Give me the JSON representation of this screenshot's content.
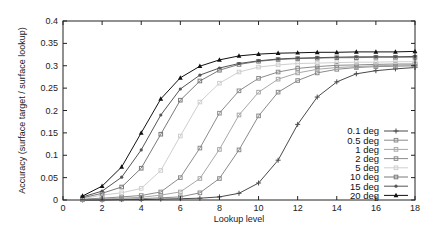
{
  "chart_data": {
    "type": "line",
    "title": "",
    "xlabel": "Lookup level",
    "ylabel": "Accuracy (surface target / surface lookup)",
    "xlim": [
      0,
      18
    ],
    "ylim": [
      0,
      0.4
    ],
    "xticks": [
      0,
      2,
      4,
      6,
      8,
      10,
      12,
      14,
      16,
      18
    ],
    "yticks": [
      0,
      0.05,
      0.1,
      0.15,
      0.2,
      0.25,
      0.3,
      0.35,
      0.4
    ],
    "ytick_labels": [
      "0",
      "0.05",
      "0.1",
      "0.15",
      "0.2",
      "0.25",
      "0.3",
      "0.35",
      "0.4"
    ],
    "grid": false,
    "legend_position": "lower right (inside)",
    "x": [
      1,
      2,
      3,
      4,
      5,
      6,
      7,
      8,
      9,
      10,
      11,
      12,
      13,
      14,
      15,
      16,
      17,
      18
    ],
    "series": [
      {
        "name": "0.1 deg",
        "color": "#4a4a4a",
        "marker": "plus",
        "values": [
          0.0,
          0.0,
          0.001,
          0.001,
          0.002,
          0.003,
          0.004,
          0.007,
          0.015,
          0.038,
          0.089,
          0.169,
          0.23,
          0.264,
          0.282,
          0.289,
          0.293,
          0.296
        ]
      },
      {
        "name": "0.5 deg",
        "color": "#8a8a8a",
        "marker": "square",
        "values": [
          0.001,
          0.001,
          0.002,
          0.003,
          0.005,
          0.007,
          0.016,
          0.048,
          0.112,
          0.188,
          0.241,
          0.267,
          0.284,
          0.292,
          0.296,
          0.298,
          0.299,
          0.3
        ]
      },
      {
        "name": "1 deg",
        "color": "#a8a8a8",
        "marker": "square",
        "values": [
          0.001,
          0.002,
          0.004,
          0.006,
          0.011,
          0.018,
          0.048,
          0.113,
          0.19,
          0.241,
          0.27,
          0.284,
          0.292,
          0.296,
          0.298,
          0.3,
          0.301,
          0.302
        ]
      },
      {
        "name": "2 deg",
        "color": "#8c8c8c",
        "marker": "square",
        "values": [
          0.002,
          0.004,
          0.007,
          0.01,
          0.018,
          0.05,
          0.116,
          0.194,
          0.244,
          0.272,
          0.286,
          0.294,
          0.298,
          0.301,
          0.302,
          0.303,
          0.304,
          0.304
        ]
      },
      {
        "name": "5 deg",
        "color": "#cfcfcf",
        "marker": "square",
        "values": [
          0.003,
          0.011,
          0.016,
          0.026,
          0.066,
          0.143,
          0.219,
          0.261,
          0.286,
          0.297,
          0.302,
          0.305,
          0.306,
          0.307,
          0.308,
          0.308,
          0.309,
          0.309
        ]
      },
      {
        "name": "10 deg",
        "color": "#7a7a7a",
        "marker": "square",
        "values": [
          0.005,
          0.015,
          0.029,
          0.071,
          0.147,
          0.223,
          0.266,
          0.29,
          0.303,
          0.31,
          0.314,
          0.316,
          0.317,
          0.318,
          0.318,
          0.319,
          0.319,
          0.319
        ]
      },
      {
        "name": "15 deg",
        "color": "#555555",
        "marker": "dot",
        "values": [
          0.007,
          0.02,
          0.051,
          0.112,
          0.19,
          0.248,
          0.279,
          0.295,
          0.305,
          0.311,
          0.315,
          0.317,
          0.318,
          0.319,
          0.32,
          0.32,
          0.32,
          0.321
        ]
      },
      {
        "name": "20 deg",
        "color": "#111111",
        "marker": "triangle",
        "values": [
          0.009,
          0.031,
          0.074,
          0.15,
          0.226,
          0.273,
          0.299,
          0.313,
          0.322,
          0.326,
          0.328,
          0.329,
          0.33,
          0.33,
          0.331,
          0.331,
          0.331,
          0.332
        ]
      }
    ]
  },
  "layout": {
    "plot_left": 63,
    "plot_top": 21,
    "plot_right": 415,
    "plot_bottom": 200
  }
}
